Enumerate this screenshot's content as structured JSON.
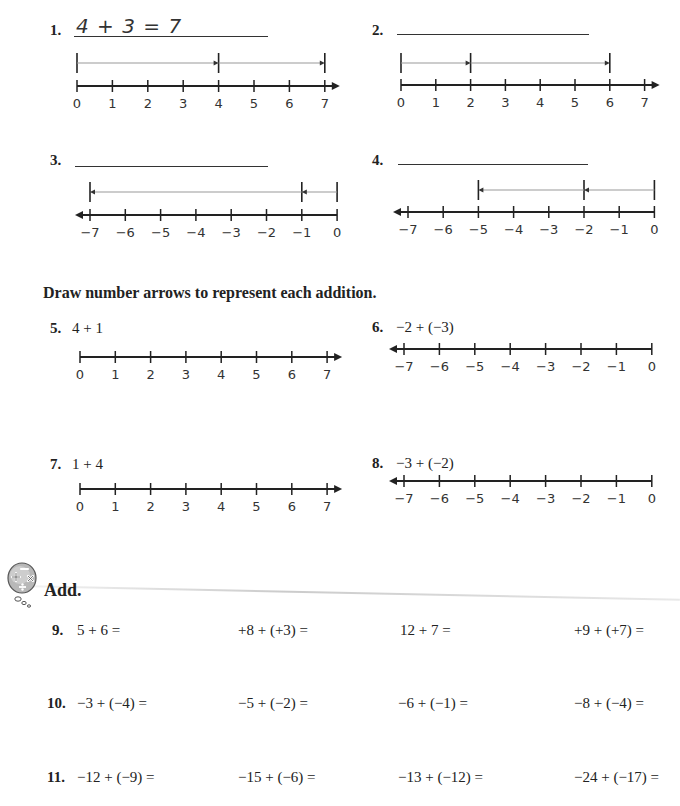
{
  "problems_top": [
    {
      "number": "1.",
      "answer": "4 + 3 = 7",
      "type": "positive",
      "labels": [
        "0",
        "1",
        "2",
        "3",
        "4",
        "5",
        "6",
        "7"
      ],
      "arrows": [
        [
          0,
          4
        ],
        [
          4,
          7
        ]
      ]
    },
    {
      "number": "2.",
      "answer": "",
      "type": "positive",
      "labels": [
        "0",
        "1",
        "2",
        "3",
        "4",
        "5",
        "6",
        "7"
      ],
      "arrows": [
        [
          0,
          2
        ],
        [
          2,
          6
        ]
      ]
    },
    {
      "number": "3.",
      "answer": "",
      "type": "negative",
      "labels": [
        "−7",
        "−6",
        "−5",
        "−4",
        "−3",
        "−2",
        "−1",
        "0"
      ],
      "arrows": [
        [
          0,
          -1
        ],
        [
          -1,
          -7
        ]
      ]
    },
    {
      "number": "4.",
      "answer": "",
      "type": "negative",
      "labels": [
        "−7",
        "−6",
        "−5",
        "−4",
        "−3",
        "−2",
        "−1",
        "0"
      ],
      "arrows": [
        [
          0,
          -2
        ],
        [
          -2,
          -5
        ]
      ]
    }
  ],
  "instruction": "Draw number arrows to represent each addition.",
  "problems_draw": [
    {
      "number": "5.",
      "expression": "4 + 1",
      "type": "positive",
      "labels": [
        "0",
        "1",
        "2",
        "3",
        "4",
        "5",
        "6",
        "7"
      ]
    },
    {
      "number": "6.",
      "expression": "−2 + (−3)",
      "type": "negative",
      "labels": [
        "−7",
        "−6",
        "−5",
        "−4",
        "−3",
        "−2",
        "−1",
        "0"
      ]
    },
    {
      "number": "7.",
      "expression": "1 + 4",
      "type": "positive",
      "labels": [
        "0",
        "1",
        "2",
        "3",
        "4",
        "5",
        "6",
        "7"
      ]
    },
    {
      "number": "8.",
      "expression": "−3 + (−2)",
      "type": "negative",
      "labels": [
        "−7",
        "−6",
        "−5",
        "−4",
        "−3",
        "−2",
        "−1",
        "0"
      ]
    }
  ],
  "add_section": {
    "icon": "math-operations-thought-bubble-icon",
    "title": "Add.",
    "rows": [
      {
        "number": "9.",
        "items": [
          "5 + 6 =",
          "+8 + (+3) =",
          "12 + 7 =",
          "+9 + (+7) ="
        ]
      },
      {
        "number": "10.",
        "items": [
          "−3 + (−4) =",
          "−5 + (−2) =",
          "−6 + (−1) =",
          "−8 + (−4) ="
        ]
      },
      {
        "number": "11.",
        "items": [
          "−12 + (−9) =",
          "−15 + (−6) =",
          "−13 + (−12) =",
          "−24 + (−17) ="
        ]
      }
    ]
  }
}
